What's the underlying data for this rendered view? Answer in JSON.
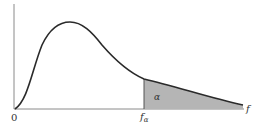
{
  "diagram": {
    "type": "F-distribution density with upper-tail critical region",
    "labels": {
      "origin": "0",
      "critical_value": "f",
      "critical_value_subscript": "α",
      "x_axis": "f",
      "tail_area": "α"
    },
    "colors": {
      "curve": "#2a2a2a",
      "axis": "#8a8a8a",
      "shaded_region": "#b5b5b5",
      "text": "#333333",
      "background": "#ffffff"
    }
  }
}
